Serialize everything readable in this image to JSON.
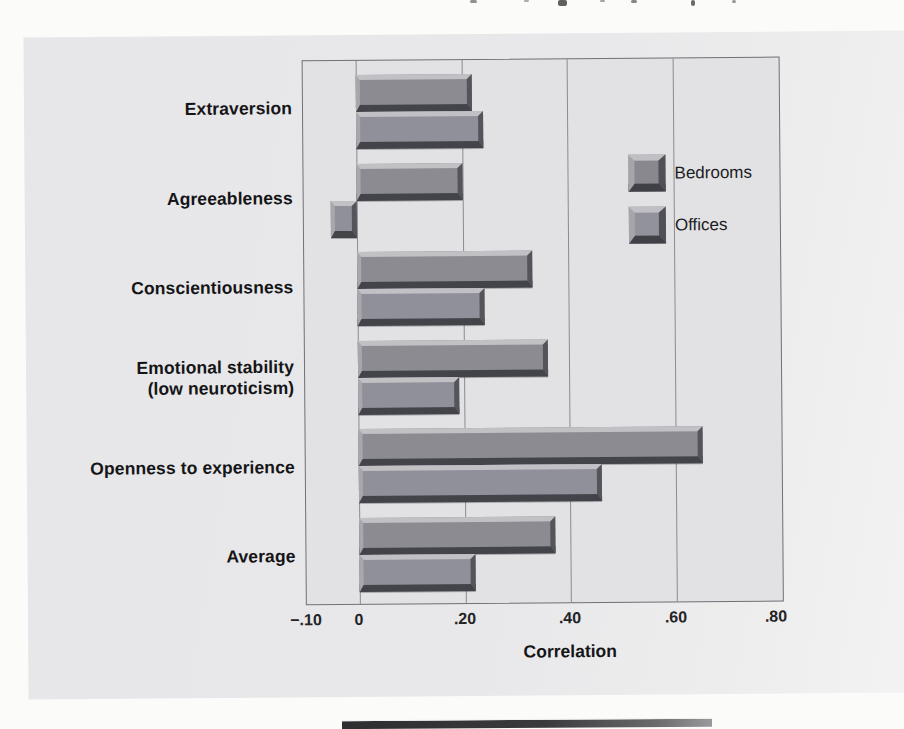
{
  "figure": {
    "category_lines": [
      [
        "Extraversion"
      ],
      [
        "Agreeableness"
      ],
      [
        "Conscientiousness"
      ],
      [
        "Emotional stability",
        "(low neuroticism)"
      ],
      [
        "Openness to experience"
      ],
      [
        "Average"
      ]
    ],
    "legend": {
      "items": [
        {
          "label": "Bedrooms"
        },
        {
          "label": "Offices"
        }
      ]
    },
    "axis": {
      "title": "Correlation",
      "tick_labels": [
        "−.10",
        "0",
        ".20",
        ".40",
        ".60",
        ".80"
      ]
    }
  },
  "chart_data": {
    "type": "bar",
    "orientation": "horizontal",
    "title": "",
    "xlabel": "Correlation",
    "ylabel": "",
    "xlim": [
      -0.1,
      0.8
    ],
    "x_ticks": [
      -0.1,
      0,
      0.2,
      0.4,
      0.6,
      0.8
    ],
    "grid": "vertical",
    "legend_position": "top-right-inside",
    "categories": [
      "Extraversion",
      "Agreeableness",
      "Conscientiousness",
      "Emotional stability (low neuroticism)",
      "Openness to experience",
      "Average"
    ],
    "series": [
      {
        "name": "Bedrooms",
        "values": [
          0.22,
          0.2,
          0.33,
          0.36,
          0.65,
          0.37
        ]
      },
      {
        "name": "Offices",
        "values": [
          0.24,
          -0.05,
          0.24,
          0.19,
          0.46,
          0.22
        ]
      }
    ]
  },
  "colors": {
    "bar_face": "#8b8b91",
    "bar_highlight": "#c0c0c5",
    "bar_shadow": "#43434a",
    "plot_background": "#e2e2e5",
    "panel_background": "#e7e7e9",
    "gridline": "#8b8b90",
    "text": "#151517"
  }
}
